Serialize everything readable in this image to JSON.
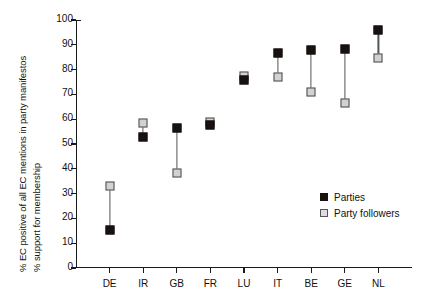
{
  "chart_data": {
    "type": "scatter",
    "title": "",
    "subtitle": "",
    "xlabel": "",
    "ylabel": "% EC positive of all EC mentions in party manifestos / % support for membership",
    "ylabel_lines": [
      "% EC positive of all EC mentions in party manifestos",
      "% support for membership"
    ],
    "categories": [
      "DE",
      "IR",
      "GB",
      "FR",
      "LU",
      "IT",
      "BE",
      "GE",
      "NL"
    ],
    "series": [
      {
        "name": "Parties",
        "color": "#17110f",
        "values": [
          15.5,
          53,
          56.5,
          57.5,
          76,
          86.5,
          88,
          88.5,
          96
        ]
      },
      {
        "name": "Party followers",
        "color": "#d2d2d2",
        "values": [
          33,
          58.5,
          38.5,
          59,
          77.5,
          77,
          71,
          66.5,
          84.5
        ]
      }
    ],
    "ylim": [
      0,
      100
    ],
    "ytick_values": [
      0,
      10,
      20,
      30,
      40,
      50,
      60,
      70,
      80,
      90,
      100
    ],
    "ytick_labels": [
      "0",
      "10",
      "20",
      "30",
      "40",
      "50",
      "60",
      "70",
      "80",
      "90",
      "100"
    ],
    "grid": false,
    "legend_position": "inside-right-middle",
    "connectors": true
  },
  "legend": {
    "items": [
      {
        "label": "Parties",
        "swatch": "filled-black-square"
      },
      {
        "label": "Party followers",
        "swatch": "open-gray-square"
      }
    ]
  }
}
